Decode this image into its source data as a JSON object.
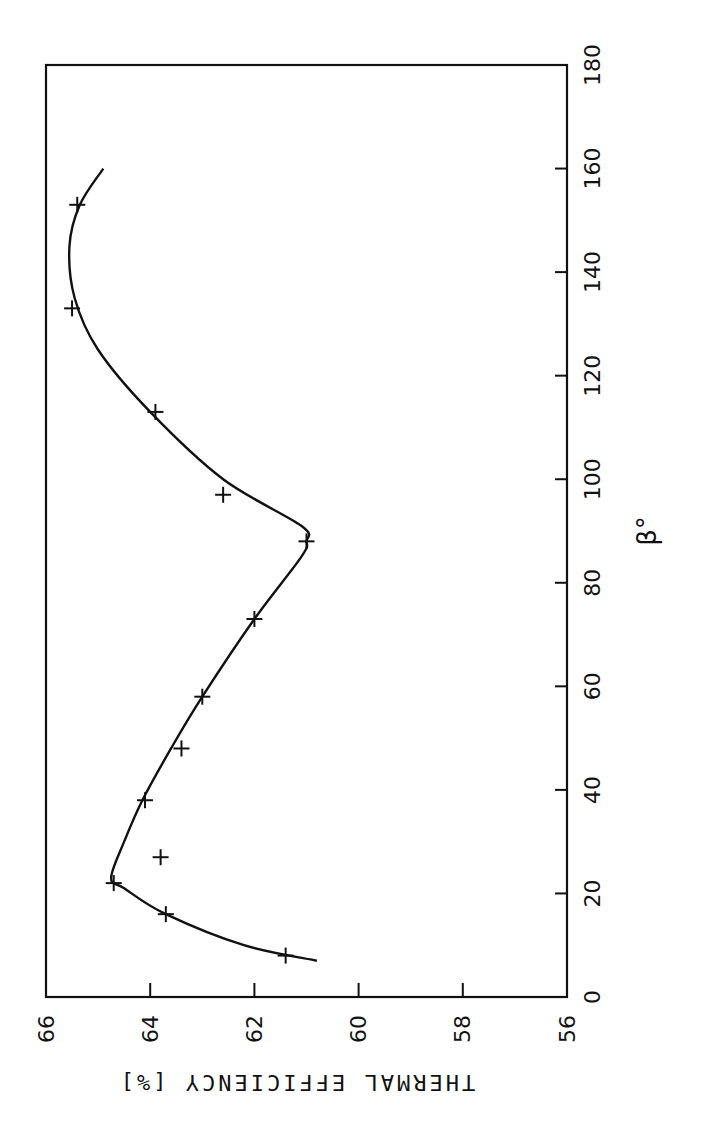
{
  "chart_data": {
    "type": "line",
    "orientation": "rotated-90-clockwise",
    "title": "",
    "xlabel": "β°",
    "ylabel": "THERMAL EFFICIENCY [%]",
    "xlim": [
      0,
      180
    ],
    "ylim": [
      56,
      66
    ],
    "x_ticks": [
      0,
      20,
      40,
      60,
      80,
      100,
      120,
      140,
      160,
      180
    ],
    "y_ticks": [
      56,
      58,
      60,
      62,
      64,
      66
    ],
    "grid": false,
    "legend": null,
    "series": [
      {
        "name": "measured",
        "marker": "+",
        "points": [
          {
            "x": 8,
            "y": 61.4
          },
          {
            "x": 16,
            "y": 63.7
          },
          {
            "x": 22,
            "y": 64.7
          },
          {
            "x": 27,
            "y": 63.8
          },
          {
            "x": 38,
            "y": 64.1
          },
          {
            "x": 48,
            "y": 63.4
          },
          {
            "x": 58,
            "y": 63.0
          },
          {
            "x": 73,
            "y": 62.0
          },
          {
            "x": 88,
            "y": 61.0
          },
          {
            "x": 97,
            "y": 62.6
          },
          {
            "x": 113,
            "y": 63.9
          },
          {
            "x": 133,
            "y": 65.5
          },
          {
            "x": 153,
            "y": 65.4
          }
        ]
      },
      {
        "name": "fitted curve",
        "marker": "none",
        "points": [
          {
            "x": 7,
            "y": 60.8
          },
          {
            "x": 10,
            "y": 62.2
          },
          {
            "x": 16,
            "y": 63.7
          },
          {
            "x": 21,
            "y": 64.5
          },
          {
            "x": 23,
            "y": 64.75
          },
          {
            "x": 30,
            "y": 64.5
          },
          {
            "x": 38,
            "y": 64.15
          },
          {
            "x": 48,
            "y": 63.6
          },
          {
            "x": 58,
            "y": 63.0
          },
          {
            "x": 73,
            "y": 62.0
          },
          {
            "x": 85,
            "y": 61.1
          },
          {
            "x": 88,
            "y": 61.0
          },
          {
            "x": 91,
            "y": 61.1
          },
          {
            "x": 100,
            "y": 62.6
          },
          {
            "x": 113,
            "y": 64.0
          },
          {
            "x": 125,
            "y": 65.0
          },
          {
            "x": 135,
            "y": 65.45
          },
          {
            "x": 145,
            "y": 65.55
          },
          {
            "x": 153,
            "y": 65.35
          },
          {
            "x": 160,
            "y": 64.9
          }
        ]
      }
    ]
  },
  "labels": {
    "xlabel": "β°",
    "ylabel": "THERMAL EFFICIENCY [%]"
  }
}
